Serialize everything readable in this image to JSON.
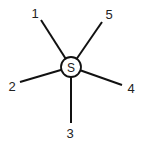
{
  "diagram": {
    "type": "star",
    "center": {
      "label": "S",
      "x": 71,
      "y": 67,
      "r": 10
    },
    "colors": {
      "stroke": "#111111",
      "fill": "#ffffff",
      "text": "#222222"
    },
    "spokes": [
      {
        "label": "1",
        "x1": 71,
        "y1": 67,
        "x2": 41,
        "y2": 20,
        "lx": 35,
        "ly": 18
      },
      {
        "label": "5",
        "x1": 71,
        "y1": 67,
        "x2": 102,
        "y2": 22,
        "lx": 109,
        "ly": 19
      },
      {
        "label": "2",
        "x1": 71,
        "y1": 67,
        "x2": 20,
        "y2": 82,
        "lx": 12,
        "ly": 91
      },
      {
        "label": "4",
        "x1": 71,
        "y1": 67,
        "x2": 122,
        "y2": 85,
        "lx": 131,
        "ly": 93
      },
      {
        "label": "3",
        "x1": 71,
        "y1": 67,
        "x2": 71,
        "y2": 123,
        "lx": 70,
        "ly": 138
      }
    ]
  }
}
